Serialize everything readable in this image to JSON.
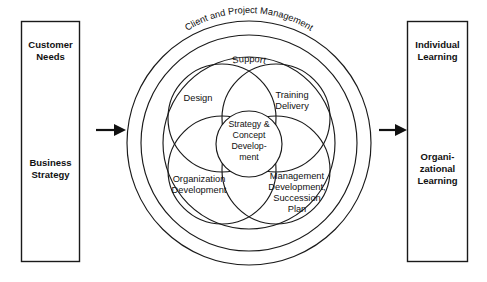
{
  "diagram": {
    "input_box": {
      "name": "input-box",
      "lines_top": [
        "Customer",
        "Needs"
      ],
      "lines_bottom": [
        "Business",
        "Strategy"
      ]
    },
    "output_box": {
      "name": "output-box",
      "lines_top": [
        "Individual",
        "Learning"
      ],
      "lines_bottom": [
        "Organi-",
        "zational",
        "Learning"
      ]
    },
    "outer_ring_label": "Client and Project Management",
    "inner_ring_label": "Support",
    "petals": [
      {
        "id": "design",
        "lines": [
          "Design"
        ]
      },
      {
        "id": "training-delivery",
        "lines": [
          "Training",
          "Delivery"
        ]
      },
      {
        "id": "organization-development",
        "lines": [
          "Organization",
          "Development"
        ]
      },
      {
        "id": "management-development",
        "lines": [
          "Management",
          "Development,",
          "Succession",
          "Plan"
        ]
      }
    ],
    "core": {
      "id": "strategy-concept-development",
      "lines": [
        "Strategy &",
        "Concept",
        "Develop-",
        "ment"
      ]
    },
    "arrows": [
      {
        "id": "arrow-input",
        "direction": "right"
      },
      {
        "id": "arrow-output",
        "direction": "right"
      }
    ],
    "colors": {
      "stroke": "#1a1a1a",
      "text": "#111111",
      "background": "#ffffff"
    }
  }
}
